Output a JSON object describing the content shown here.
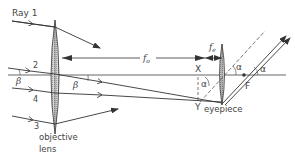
{
  "labels": {
    "ray1": "Ray 1",
    "ray2": "2",
    "ray3": "3",
    "ray4": "4",
    "beta_left": "β",
    "beta_right": "β",
    "fo": "f",
    "fo_sub": "o",
    "fe": "f",
    "fe_sub": "e",
    "point_x": "X",
    "point_y": "Y",
    "point_f": "F",
    "alpha1": "α",
    "alpha2": "α",
    "alpha3": "α",
    "objective_line1": "objective",
    "objective_line2": "lens",
    "eyepiece": "eyepiece"
  },
  "colors": {
    "line": "#333333",
    "lens_fill": "#c8c8c8",
    "text": "#444444"
  }
}
